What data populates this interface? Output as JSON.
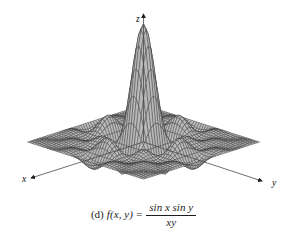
{
  "figure": {
    "part_label": "(d)",
    "function_text": "f(x, y)",
    "equals": "=",
    "numerator": "sin x sin y",
    "denominator": "xy",
    "caption_full": "(d) f(x, y) = sin x sin y / xy",
    "background_color": "#ffffff",
    "ink_color": "#1a1a1a"
  },
  "axes": {
    "x_label": "x",
    "y_label": "y",
    "z_label": "z",
    "axis_color": "#4a4a4a",
    "arrow_color": "#1a1a1a"
  },
  "chart_data": {
    "type": "surface",
    "function": "sin(x)*sin(y)/(x*y)",
    "xlabel": "x",
    "ylabel": "y",
    "zlabel": "z",
    "xlim": [
      -12.566,
      12.566
    ],
    "ylim": [
      -12.566,
      12.566
    ],
    "zlim": [
      -0.25,
      1.0
    ],
    "grid": true,
    "legend": "none",
    "mesh_n": 48,
    "mesh_line_color": "#3a3a3a",
    "surface_fill_color": "#b9b9b9",
    "peak_value": 1.0,
    "peak_location": [
      0,
      0
    ]
  }
}
